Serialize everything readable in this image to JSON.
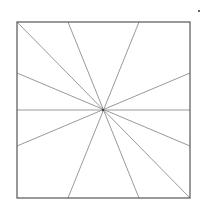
{
  "diagram": {
    "type": "square-with-radiating-lines",
    "square": {
      "x": 17,
      "y": 22,
      "width": 173,
      "height": 176,
      "stroke": "#555555"
    },
    "center": {
      "x": 103,
      "y": 110
    },
    "line_color": "#9a9a9a",
    "lines": [
      {
        "x1": 17,
        "y1": 22,
        "x2": 190,
        "y2": 198
      },
      {
        "x1": 68,
        "y1": 22,
        "x2": 139,
        "y2": 198
      },
      {
        "x1": 139,
        "y1": 22,
        "x2": 68,
        "y2": 198
      },
      {
        "x1": 17,
        "y1": 73,
        "x2": 190,
        "y2": 146
      },
      {
        "x1": 17,
        "y1": 110,
        "x2": 190,
        "y2": 110
      },
      {
        "x1": 17,
        "y1": 146,
        "x2": 190,
        "y2": 73
      }
    ],
    "marker": {
      "x": 199,
      "y": 11,
      "color": "#333333"
    }
  }
}
